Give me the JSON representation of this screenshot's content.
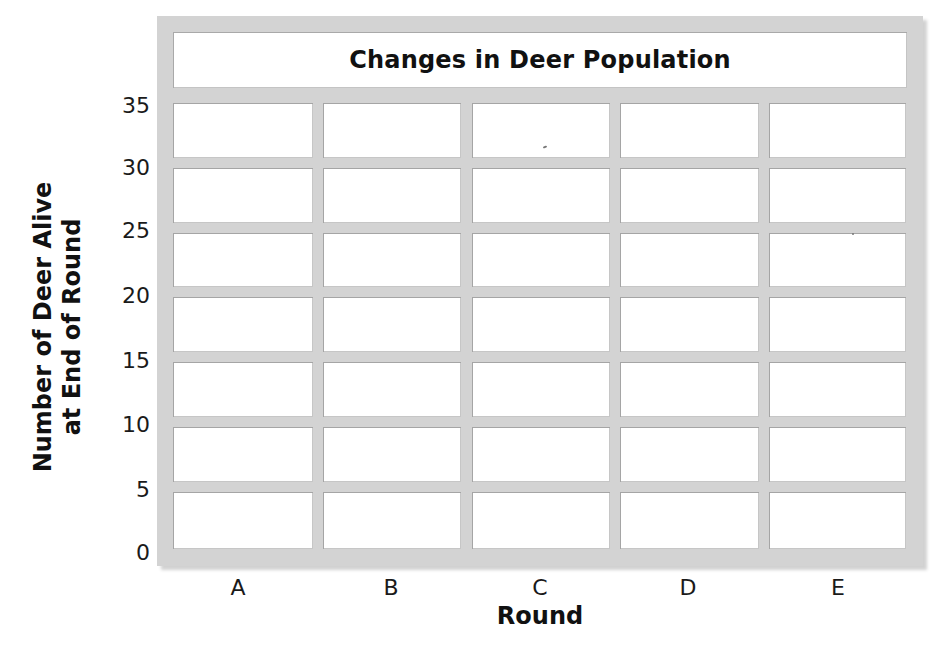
{
  "chart_data": {
    "type": "table",
    "title": "Changes in Deer Population",
    "xlabel": "Round",
    "ylabel": [
      "Number of Deer Alive",
      "at End of Round"
    ],
    "categories": [
      "A",
      "B",
      "C",
      "D",
      "E"
    ],
    "y_ticks": [
      "35",
      "30",
      "25",
      "20",
      "15",
      "10",
      "5",
      "0"
    ],
    "ylim": [
      0,
      35
    ],
    "grid": true,
    "series": [
      {
        "name": "Number of Deer Alive",
        "values": [
          null,
          null,
          null,
          null,
          null
        ]
      }
    ],
    "note": "Blank grid template — no data values plotted"
  },
  "colors": {
    "frame": "#d3d3d3",
    "cell": "#ffffff",
    "text": "#111111"
  }
}
